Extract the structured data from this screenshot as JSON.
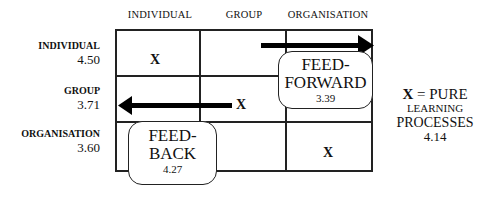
{
  "columns": [
    {
      "label": "INDIVIDUAL"
    },
    {
      "label": "GROUP"
    },
    {
      "label": "ORGANISATION"
    }
  ],
  "rows": [
    {
      "label": "INDIVIDUAL",
      "value": "4.50"
    },
    {
      "label": "GROUP",
      "value": "3.71"
    },
    {
      "label": "ORGANISATION",
      "value": "3.60"
    }
  ],
  "cells": {
    "individual_individual": "X",
    "group_organisation": "X",
    "organisation_organisation": "X"
  },
  "feed_forward": {
    "line1": "FEED-",
    "line2": "FORWARD",
    "value": "3.39",
    "arrow_direction": "right"
  },
  "feed_back": {
    "line1": "FEED-",
    "line2": "BACK",
    "value": "4.27",
    "arrow_direction": "left"
  },
  "legend": {
    "symbol": "X",
    "line1_rest": " = PURE",
    "line2": "LEARNING",
    "line3": "PROCESSES",
    "value": "4.14"
  }
}
